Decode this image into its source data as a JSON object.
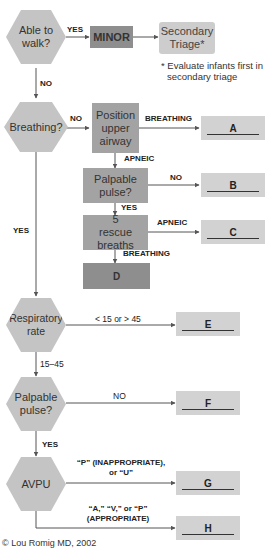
{
  "nodes": {
    "able_to_walk": "Able to walk?",
    "minor": "MINOR",
    "secondary_triage": "Secondary Triage*",
    "breathing": "Breathing?",
    "position_airway": "Position upper airway",
    "palpable_pulse_1": "Palpable pulse?",
    "rescue_breaths": "5 rescue breaths",
    "d": "D",
    "respiratory_rate": "Respiratory rate",
    "palpable_pulse_2": "Palpable pulse?",
    "avpu": "AVPU"
  },
  "outcomes": {
    "a": "A",
    "b": "B",
    "c": "C",
    "e": "E",
    "f": "F",
    "g": "G",
    "h": "H"
  },
  "labels": {
    "walk_yes": "YES",
    "walk_no": "NO",
    "breathing_no": "NO",
    "breathing_yes": "YES",
    "airway_breathing": "BREATHING",
    "airway_apneic": "APNEIC",
    "pulse1_no": "NO",
    "pulse1_yes": "YES",
    "rescue_apneic": "APNEIC",
    "rescue_breathing": "BREATHING",
    "rr_abnormal": "< 15 or > 45",
    "rr_normal": "15–45",
    "pulse2_no": "NO",
    "pulse2_yes": "YES",
    "avpu_inappropriate_1": "“P” (INAPPROPRIATE),",
    "avpu_inappropriate_2": "or “U”",
    "avpu_appropriate_1": "“A,” “V,” or “P”",
    "avpu_appropriate_2": "(APPROPRIATE)"
  },
  "footnote": {
    "line1": "* Evaluate infants first in",
    "line2": "secondary triage"
  },
  "copyright": "© Lou Romig MD, 2002",
  "colors": {
    "hexagon": "#c4c4c4",
    "dark_box": "#8e8e8e",
    "mid_box": "#a3a3a3",
    "light_box": "#cdcdcd",
    "outcome_box": "#d2d2d2",
    "line": "#555555"
  }
}
